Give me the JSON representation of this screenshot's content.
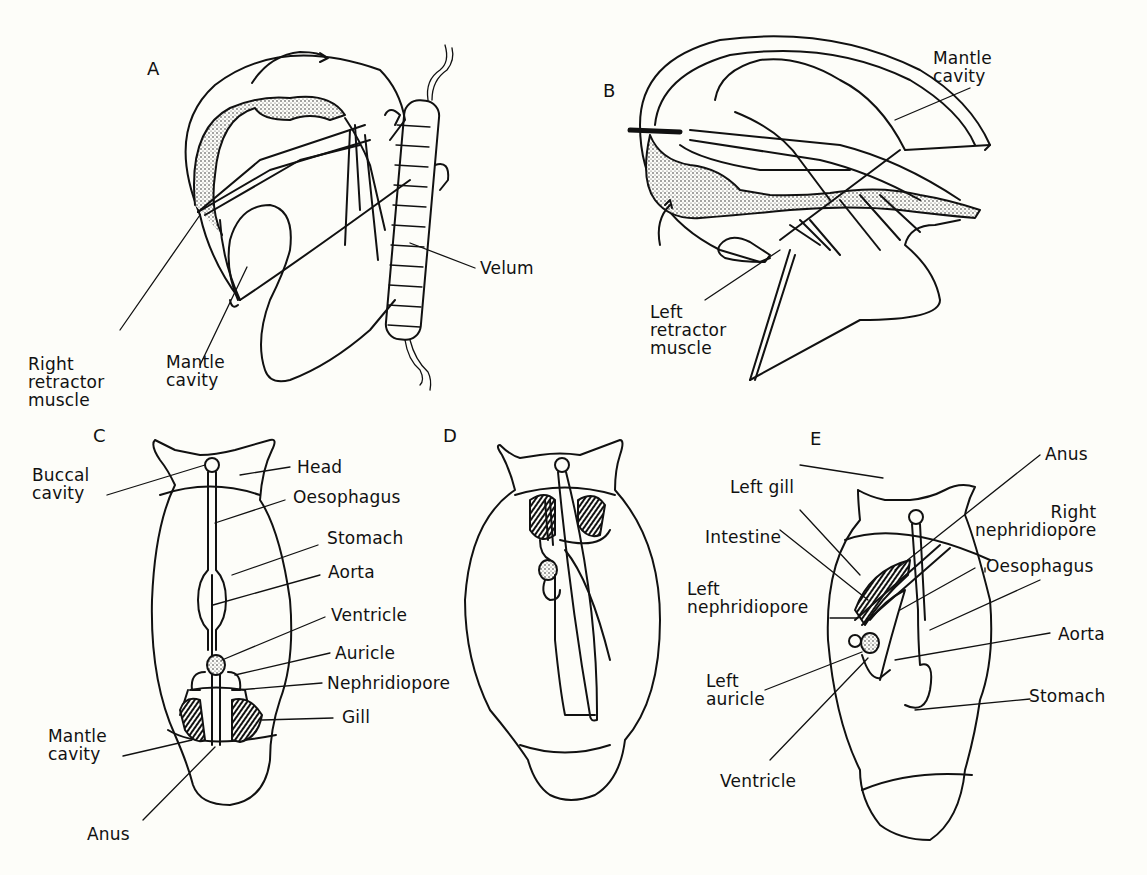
{
  "figure": {
    "panels": [
      {
        "id": "A",
        "labels": [
          "Right\nretractor\nmuscle",
          "Mantle\ncavity",
          "Velum"
        ]
      },
      {
        "id": "B",
        "labels": [
          "Mantle\ncavity",
          "Left\nretractor\nmuscle"
        ]
      },
      {
        "id": "C",
        "labels": [
          "Buccal\ncavity",
          "Head",
          "Oesophagus",
          "Stomach",
          "Aorta",
          "Ventricle",
          "Auricle",
          "Nephridiopore",
          "Gill",
          "Mantle\ncavity",
          "Anus"
        ]
      },
      {
        "id": "D",
        "labels": []
      },
      {
        "id": "E",
        "labels": [
          "Anus",
          "Left gill",
          "Right\nnephridiopore",
          "Intestine",
          "Oesophagus",
          "Left\nnephridiopore",
          "Aorta",
          "Left\nauricle",
          "Stomach",
          "Ventricle"
        ]
      }
    ]
  },
  "colors": {
    "ink": "#111111",
    "paper": "#fdfdf9",
    "stipple": "#d8d8d0"
  }
}
